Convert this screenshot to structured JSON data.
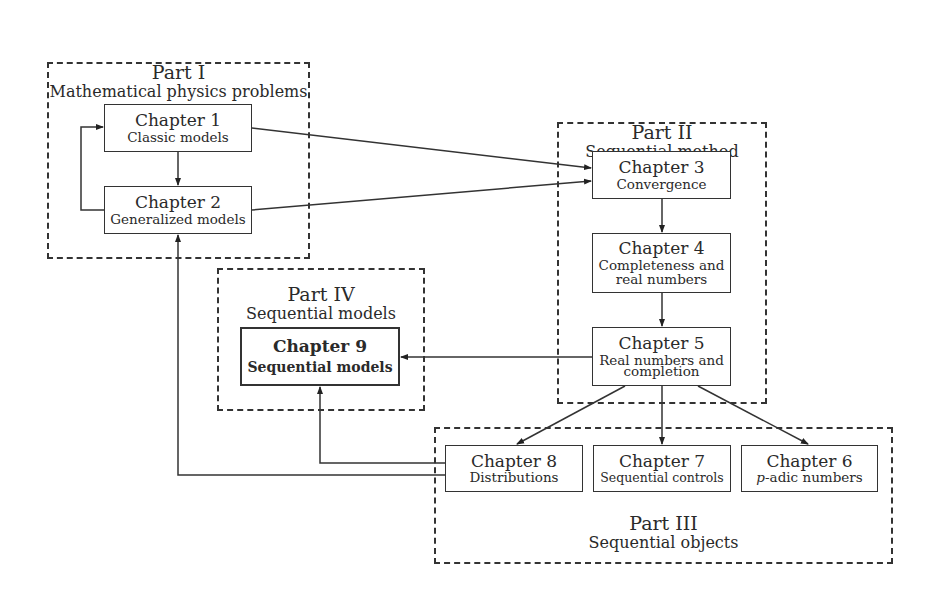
{
  "parts": [
    {
      "id": "part1",
      "number": "Part I",
      "title": "Mathematical physics problems"
    },
    {
      "id": "part2",
      "number": "Part II",
      "title": "Sequential method"
    },
    {
      "id": "part3",
      "number": "Part III",
      "title": "Sequential objects"
    },
    {
      "id": "part4",
      "number": "Part IV",
      "title": "Sequential models"
    }
  ],
  "chapters": {
    "ch1": {
      "number": "Chapter 1",
      "title": "Classic models"
    },
    "ch2": {
      "number": "Chapter 2",
      "title": "Generalized models"
    },
    "ch3": {
      "number": "Chapter 3",
      "title": "Convergence"
    },
    "ch4": {
      "number": "Chapter 4",
      "title_line1": "Completeness and",
      "title_line2": "real numbers"
    },
    "ch5": {
      "number": "Chapter 5",
      "title_line1": "Real numbers and",
      "title_line2": "completion"
    },
    "ch6": {
      "number": "Chapter 6",
      "title_italic": "p",
      "title_rest": "-adic numbers"
    },
    "ch7": {
      "number": "Chapter 7",
      "title": "Sequential controls"
    },
    "ch8": {
      "number": "Chapter 8",
      "title": "Distributions"
    },
    "ch9": {
      "number": "Chapter 9",
      "title": "Sequential models"
    }
  },
  "edges": [
    [
      "ch1",
      "ch2"
    ],
    [
      "ch2",
      "ch1"
    ],
    [
      "ch1",
      "ch3"
    ],
    [
      "ch2",
      "ch3"
    ],
    [
      "ch3",
      "ch4"
    ],
    [
      "ch4",
      "ch5"
    ],
    [
      "ch5",
      "ch9"
    ],
    [
      "ch5",
      "ch8"
    ],
    [
      "ch5",
      "ch7"
    ],
    [
      "ch5",
      "ch6"
    ],
    [
      "ch8",
      "ch9"
    ],
    [
      "ch8",
      "ch2"
    ]
  ]
}
